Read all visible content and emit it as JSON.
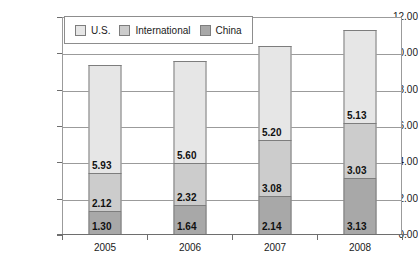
{
  "chart_data": {
    "type": "bar",
    "stacked": true,
    "title": "",
    "xlabel": "",
    "ylabel": "Sales (in $ billions)",
    "categories": [
      "2005",
      "2006",
      "2007",
      "2008"
    ],
    "ylim": [
      0,
      12
    ],
    "ytick_step": 2,
    "ytick_labels": [
      "0.00",
      "2.00",
      "4.00",
      "6.00",
      "8.00",
      "10.00",
      "12.00"
    ],
    "grid": true,
    "legend_position": "top-left-inside",
    "series": [
      {
        "name": "China",
        "color": "#a8a8a8",
        "values": [
          1.3,
          1.64,
          2.14,
          3.13
        ],
        "labels": [
          "1.30",
          "1.64",
          "2.14",
          "3.13"
        ]
      },
      {
        "name": "International",
        "color": "#cccccc",
        "values": [
          2.12,
          2.32,
          3.08,
          3.03
        ],
        "labels": [
          "2.12",
          "2.32",
          "3.08",
          "3.03"
        ]
      },
      {
        "name": "U.S.",
        "color": "#e6e6e6",
        "values": [
          5.93,
          5.6,
          5.2,
          5.13
        ],
        "labels": [
          "5.93",
          "5.60",
          "5.20",
          "5.13"
        ]
      }
    ],
    "totals": [
      9.35,
      9.56,
      10.42,
      11.29
    ]
  },
  "legend": {
    "items": [
      {
        "label": "U.S.",
        "color": "#e6e6e6"
      },
      {
        "label": "International",
        "color": "#cccccc"
      },
      {
        "label": "China",
        "color": "#a8a8a8"
      }
    ]
  },
  "axis": {
    "y_title": "Sales (in $ billions)",
    "y_ticks": [
      "12.00",
      "10.00",
      "8.00",
      "6.00",
      "4.00",
      "2.00",
      "0.00"
    ],
    "x_ticks": [
      "2005",
      "2006",
      "2007",
      "2008"
    ]
  }
}
